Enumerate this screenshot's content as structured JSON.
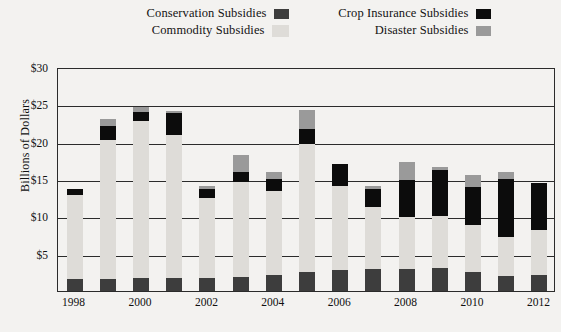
{
  "chart_data": {
    "type": "bar",
    "subtype": "stacked-column",
    "title": "",
    "xlabel": "",
    "ylabel": "Billions of Dollars",
    "ylim": [
      0,
      30
    ],
    "ytick_values": [
      5,
      10,
      15,
      20,
      25,
      30
    ],
    "ytick_labels": [
      "$5",
      "$10",
      "$15",
      "$20",
      "$25",
      "$30"
    ],
    "grid": "horizontal",
    "legend_position": "top",
    "categories": [
      "1998",
      "1999",
      "2000",
      "2001",
      "2002",
      "2003",
      "2004",
      "2005",
      "2006",
      "2007",
      "2008",
      "2009",
      "2010",
      "2011",
      "2012"
    ],
    "xtick_labels": [
      "1998",
      "2000",
      "2002",
      "2004",
      "2006",
      "2008",
      "2010",
      "2012"
    ],
    "xtick_categories": [
      "1998",
      "2000",
      "2002",
      "2004",
      "2006",
      "2008",
      "2010",
      "2012"
    ],
    "series": [
      {
        "name": "Conservation Subsidies",
        "color": "#3d3d3d",
        "values": [
          1.6,
          1.6,
          1.7,
          1.7,
          1.8,
          1.9,
          2.2,
          2.6,
          2.8,
          2.9,
          3.0,
          3.1,
          2.6,
          2.0,
          2.1
        ]
      },
      {
        "name": "Commodity Subsidies",
        "color": "#dedcd8",
        "values": [
          11.3,
          18.6,
          21.1,
          19.2,
          10.7,
          12.7,
          11.2,
          17.1,
          11.2,
          8.4,
          6.9,
          7.0,
          6.3,
          5.3,
          6.1
        ]
      },
      {
        "name": "Crop Insurance Subsidies",
        "color": "#0c0c0c",
        "values": [
          0.7,
          1.9,
          1.2,
          2.9,
          1.2,
          1.4,
          1.6,
          2.0,
          3.0,
          2.4,
          5.0,
          6.1,
          5.0,
          7.7,
          6.3
        ]
      },
      {
        "name": "Disaster Subsidies",
        "color": "#9a9a9a",
        "values": [
          0.0,
          1.0,
          0.6,
          0.3,
          0.4,
          2.2,
          0.9,
          2.6,
          0.0,
          0.3,
          2.4,
          0.4,
          1.6,
          0.9,
          0.0
        ]
      }
    ],
    "totals": [
      13.6,
      23.1,
      24.6,
      24.1,
      14.1,
      18.2,
      15.9,
      24.3,
      17.0,
      14.0,
      17.3,
      16.6,
      15.5,
      15.9,
      14.5
    ]
  },
  "legend": {
    "rows": [
      {
        "left_label": "Conservation Subsidies",
        "left_color": "#3d3d3d",
        "right_label": "Crop Insurance Subsidies",
        "right_color": "#0c0c0c"
      },
      {
        "left_label": "Commodity Subsidies",
        "left_color": "#dedcd8",
        "right_label": "Disaster Subsidies",
        "right_color": "#9a9a9a"
      }
    ]
  },
  "axis": {
    "y_title": "Billions of Dollars"
  },
  "colors": {
    "background": "#f3f2f0",
    "axis": "#2b2b2b",
    "text": "#101010"
  }
}
